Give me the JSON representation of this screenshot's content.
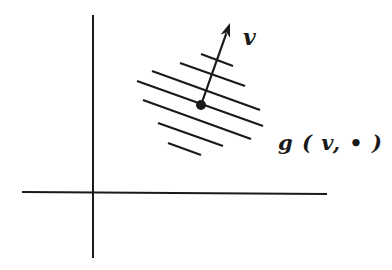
{
  "diagram": {
    "colors": {
      "ink": "#1a1a1a",
      "background": "#ffffff"
    },
    "axes": {
      "vertical": {
        "x1": 93,
        "y1": 15,
        "x2": 93,
        "y2": 258
      },
      "horizontal": {
        "x1": 22,
        "y1": 192,
        "x2": 327,
        "y2": 194
      }
    },
    "level_lines": [
      {
        "x1": 201,
        "y1": 54,
        "x2": 233,
        "y2": 66
      },
      {
        "x1": 180,
        "y1": 63,
        "x2": 245,
        "y2": 86
      },
      {
        "x1": 152,
        "y1": 71,
        "x2": 260,
        "y2": 110
      },
      {
        "x1": 137,
        "y1": 81,
        "x2": 263,
        "y2": 126
      },
      {
        "x1": 143,
        "y1": 100,
        "x2": 251,
        "y2": 139
      },
      {
        "x1": 158,
        "y1": 123,
        "x2": 223,
        "y2": 146
      },
      {
        "x1": 168,
        "y1": 143,
        "x2": 201,
        "y2": 155
      }
    ],
    "point": {
      "cx": 201,
      "cy": 105,
      "r": 5
    },
    "vector": {
      "x1": 201,
      "y1": 105,
      "x2": 230,
      "y2": 23
    },
    "labels": {
      "vector": "v",
      "covector": "g ( v, • )"
    }
  }
}
